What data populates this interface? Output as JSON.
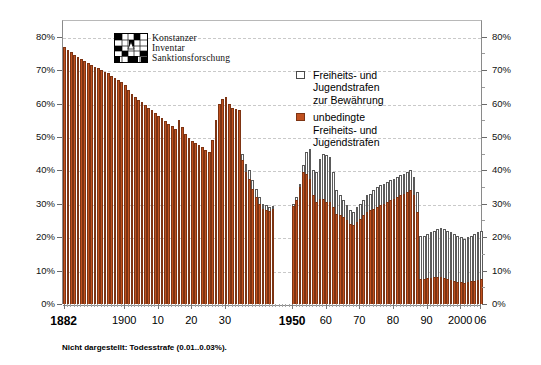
{
  "chart_data": {
    "type": "bar",
    "stacked": true,
    "title": "",
    "subtitle": "",
    "xlabel": "",
    "ylabel": "",
    "ylim": [
      0,
      85
    ],
    "ytick_values": [
      0,
      10,
      20,
      30,
      40,
      50,
      60,
      70,
      80
    ],
    "ytick_labels": [
      "0%",
      "10%",
      "20%",
      "30%",
      "40%",
      "50%",
      "60%",
      "70%",
      "80%"
    ],
    "y_minor_step": 5,
    "grid": true,
    "grid_axis": "y",
    "legend_position": "upper-center-right",
    "axis_right_mirror": true,
    "xtick_labels": [
      "1882",
      "1900",
      "10",
      "20",
      "30",
      "1950",
      "60",
      "70",
      "80",
      "90",
      "2000",
      "06"
    ],
    "xtick_years": [
      1882,
      1900,
      1910,
      1920,
      1930,
      1950,
      1960,
      1970,
      1980,
      1990,
      2000,
      2006
    ],
    "xtick_bold": [
      true,
      false,
      false,
      false,
      false,
      true,
      false,
      false,
      false,
      false,
      false,
      false
    ],
    "gap_years": [
      1945,
      1946,
      1947,
      1948,
      1949
    ],
    "footnote": "Nicht dargestellt: Todesstrafe (0.01..0.03%).",
    "series": [
      {
        "name": "Freiheits- und Jugendstrafen zur Bewährung",
        "key": "conditional",
        "color": "#ffffff",
        "edge_color": "#5a5a5a",
        "stack_order": 2
      },
      {
        "name": "unbedingte Freiheits- und Jugendstrafen",
        "key": "unconditional",
        "color": "#c0511f",
        "edge_color": "#7d3413",
        "stack_order": 1
      }
    ],
    "years": [
      1882,
      1883,
      1884,
      1885,
      1886,
      1887,
      1888,
      1889,
      1890,
      1891,
      1892,
      1893,
      1894,
      1895,
      1896,
      1897,
      1898,
      1899,
      1900,
      1901,
      1902,
      1903,
      1904,
      1905,
      1906,
      1907,
      1908,
      1909,
      1910,
      1911,
      1912,
      1913,
      1914,
      1915,
      1916,
      1917,
      1918,
      1919,
      1920,
      1921,
      1922,
      1923,
      1924,
      1925,
      1926,
      1927,
      1928,
      1929,
      1930,
      1931,
      1932,
      1933,
      1934,
      1935,
      1936,
      1937,
      1938,
      1939,
      1940,
      1941,
      1942,
      1943,
      1944,
      1950,
      1951,
      1952,
      1953,
      1954,
      1955,
      1956,
      1957,
      1958,
      1959,
      1960,
      1961,
      1962,
      1963,
      1964,
      1965,
      1966,
      1967,
      1968,
      1969,
      1970,
      1971,
      1972,
      1973,
      1974,
      1975,
      1976,
      1977,
      1978,
      1979,
      1980,
      1981,
      1982,
      1983,
      1984,
      1985,
      1986,
      1987,
      1988,
      1989,
      1990,
      1991,
      1992,
      1993,
      1994,
      1995,
      1996,
      1997,
      1998,
      1999,
      2000,
      2001,
      2002,
      2003,
      2004,
      2005,
      2006
    ],
    "total": [
      77.0,
      76.0,
      75.3,
      74.6,
      74.0,
      73.4,
      72.8,
      72.2,
      71.6,
      71.0,
      70.5,
      70.0,
      69.5,
      69.0,
      68.2,
      67.6,
      67.0,
      66.3,
      65.6,
      64.0,
      63.0,
      62.0,
      61.2,
      60.5,
      59.6,
      58.8,
      58.0,
      57.2,
      56.4,
      55.6,
      54.8,
      54.0,
      53.2,
      52.4,
      55.0,
      53.0,
      50.8,
      49.6,
      48.8,
      48.2,
      47.6,
      47.0,
      46.2,
      45.5,
      49.0,
      55.0,
      60.0,
      61.5,
      62.0,
      60.0,
      58.8,
      58.5,
      58.0,
      45.0,
      42.0,
      40.0,
      37.0,
      34.5,
      32.0,
      30.0,
      29.6,
      29.0,
      29.3,
      30.0,
      32.0,
      36.0,
      41.5,
      45.5,
      46.5,
      40.0,
      39.5,
      43.5,
      45.0,
      44.5,
      44.0,
      39.5,
      34.0,
      32.5,
      31.0,
      29.5,
      28.0,
      27.5,
      29.0,
      30.0,
      31.0,
      32.5,
      33.0,
      34.0,
      35.0,
      35.5,
      36.0,
      36.5,
      37.0,
      37.5,
      38.0,
      38.5,
      39.0,
      39.5,
      40.0,
      38.0,
      33.5,
      20.5,
      20.5,
      21.0,
      21.5,
      22.0,
      22.5,
      22.8,
      22.5,
      22.0,
      21.5,
      21.0,
      20.5,
      20.0,
      19.5,
      20.0,
      20.5,
      21.0,
      21.5,
      22.0,
      22.2,
      22.4,
      22.0,
      21.5,
      21.8,
      22.2,
      21.8,
      22.0
    ],
    "unconditional": [
      77.0,
      76.0,
      75.3,
      74.6,
      74.0,
      73.4,
      72.8,
      72.2,
      71.6,
      71.0,
      70.5,
      70.0,
      69.5,
      69.0,
      68.2,
      67.6,
      67.0,
      66.3,
      65.6,
      64.0,
      63.0,
      62.0,
      61.2,
      60.5,
      59.6,
      58.8,
      58.0,
      57.2,
      56.4,
      55.6,
      54.8,
      54.0,
      53.2,
      52.4,
      55.0,
      53.0,
      50.8,
      49.6,
      48.8,
      48.2,
      47.6,
      47.0,
      46.2,
      45.5,
      49.0,
      55.0,
      60.0,
      61.5,
      62.0,
      60.0,
      58.8,
      58.5,
      58.0,
      43.0,
      39.5,
      37.5,
      34.5,
      32.0,
      30.0,
      28.3,
      28.2,
      27.8,
      28.3,
      29.3,
      31.2,
      35.0,
      39.5,
      39.0,
      37.5,
      32.5,
      30.5,
      31.5,
      31.5,
      30.5,
      30.5,
      29.0,
      27.0,
      26.5,
      26.0,
      25.0,
      24.0,
      23.5,
      24.5,
      25.5,
      26.5,
      27.5,
      28.0,
      28.5,
      29.0,
      29.5,
      30.0,
      30.5,
      31.0,
      31.5,
      32.0,
      32.5,
      33.0,
      33.5,
      34.0,
      32.5,
      27.5,
      7.5,
      7.5,
      7.7,
      7.8,
      8.0,
      8.1,
      8.0,
      7.8,
      7.5,
      7.2,
      7.0,
      6.7,
      6.5,
      6.3,
      6.5,
      6.8,
      7.0,
      7.3,
      7.6,
      7.8,
      8.0,
      8.4,
      8.6,
      8.8,
      9.0,
      8.8,
      9.0
    ]
  },
  "legend": {
    "items": [
      {
        "swatch": "open",
        "lines": [
          "Freiheits- und",
          "Jugendstrafen",
          "zur Bewährung"
        ]
      },
      {
        "swatch": "filled",
        "lines": [
          "unbedingte",
          "Freiheits- und",
          "Jugendstrafen"
        ]
      }
    ]
  },
  "logo": {
    "line1": "Konstanzer",
    "line2": "Inventar",
    "line3": "Sanktionsforschung"
  },
  "colors": {
    "unconditional": "#c0511f",
    "unconditional_edge": "#7d3413",
    "conditional": "#ffffff",
    "conditional_edge": "#5a5a5a",
    "grid": "#c9c9c9",
    "axis": "#8a8a8a"
  }
}
